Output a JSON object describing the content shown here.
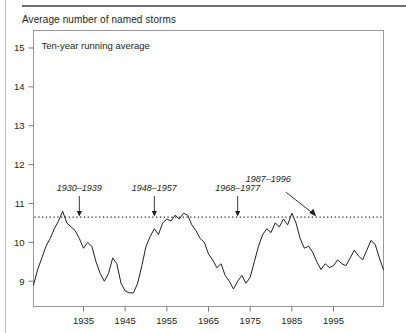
{
  "figure": {
    "title": "Average number of named storms",
    "panel_label": "Ten-year running average"
  },
  "chart_data": {
    "type": "line",
    "title": "Average number of named storms",
    "subtitle": "Ten-year running average",
    "xlabel": "",
    "ylabel": "",
    "xlim": [
      1923,
      2007
    ],
    "ylim": [
      8.35,
      15.45
    ],
    "xticks": [
      1935,
      1945,
      1955,
      1965,
      1975,
      1985,
      1995
    ],
    "yticks": [
      9,
      10,
      11,
      12,
      13,
      14,
      15
    ],
    "grid": false,
    "legend": "none",
    "reference_line": {
      "label": "long-term average",
      "value": 10.65,
      "style": "dotted",
      "orientation": "horizontal"
    },
    "annotations": [
      {
        "text": "1930–1939",
        "x": 1934,
        "y": 10.65,
        "arrow": "down"
      },
      {
        "text": "1948–1957",
        "x": 1952,
        "y": 10.65,
        "arrow": "down"
      },
      {
        "text": "1968–1977",
        "x": 1972,
        "y": 10.65,
        "arrow": "down"
      },
      {
        "text": "1987–1996",
        "x": 1991,
        "y": 10.65,
        "arrow": "diagonal-down-right"
      },
      {
        "text": "1998–2007",
        "x": 2002,
        "y": 15.1,
        "arrow": "right"
      }
    ],
    "x": [
      1923,
      1924,
      1925,
      1926,
      1927,
      1928,
      1929,
      1930,
      1931,
      1932,
      1933,
      1934,
      1935,
      1936,
      1937,
      1938,
      1939,
      1940,
      1941,
      1942,
      1943,
      1944,
      1945,
      1946,
      1947,
      1948,
      1949,
      1950,
      1951,
      1952,
      1953,
      1954,
      1955,
      1956,
      1957,
      1958,
      1959,
      1960,
      1961,
      1962,
      1963,
      1964,
      1965,
      1966,
      1967,
      1968,
      1969,
      1970,
      1971,
      1972,
      1973,
      1974,
      1975,
      1976,
      1977,
      1978,
      1979,
      1980,
      1981,
      1982,
      1983,
      1984,
      1985,
      1986,
      1987,
      1988,
      1989,
      1990,
      1991,
      1992,
      1993,
      1994,
      1995,
      1996,
      1997,
      1998,
      1999,
      2000,
      2001,
      2002,
      2003,
      2004,
      2005,
      2006,
      2007
    ],
    "values": [
      8.9,
      9.3,
      9.6,
      9.9,
      10.1,
      10.35,
      10.55,
      10.8,
      10.5,
      10.4,
      10.3,
      10.1,
      9.85,
      10.0,
      9.9,
      9.5,
      9.2,
      9.0,
      9.2,
      9.6,
      9.45,
      8.95,
      8.75,
      8.7,
      8.7,
      8.95,
      9.4,
      9.9,
      10.15,
      10.35,
      10.2,
      10.5,
      10.6,
      10.55,
      10.7,
      10.6,
      10.75,
      10.7,
      10.45,
      10.3,
      10.1,
      10.0,
      9.7,
      9.55,
      9.35,
      9.45,
      9.15,
      9.0,
      8.8,
      9.0,
      9.15,
      8.95,
      9.1,
      9.5,
      9.9,
      10.2,
      10.35,
      10.25,
      10.5,
      10.4,
      10.6,
      10.45,
      10.75,
      10.5,
      10.1,
      9.85,
      9.9,
      9.75,
      9.5,
      9.3,
      9.45,
      9.35,
      9.4,
      9.55,
      9.45,
      9.4,
      9.6,
      9.8,
      9.65,
      9.55,
      9.8,
      10.05,
      9.95,
      9.6,
      9.3
    ]
  }
}
